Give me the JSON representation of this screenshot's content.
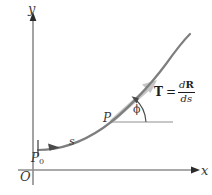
{
  "figure": {
    "type": "geometry-diagram",
    "background_color": "#ffffff",
    "axes": {
      "x_label": "x",
      "y_label": "y",
      "origin_label": "O",
      "axis_color": "#8c8c8c",
      "arrowhead_color": "#2b2b2b",
      "origin_px": {
        "x": 33,
        "y": 170
      },
      "x_end_px": {
        "x": 197,
        "y": 170
      },
      "y_end_px": {
        "x": 33,
        "y": 12
      }
    },
    "curve": {
      "color": "#7e7e7e",
      "width_px": 2.2,
      "start_px": {
        "x": 38,
        "y": 150
      },
      "end_px": {
        "x": 190,
        "y": 34
      },
      "shape": "concave-up increasing"
    },
    "labels": {
      "start_point": "P",
      "start_point_subscript": "0",
      "arc_length": "s",
      "tangent_point": "P",
      "angle": "ϕ"
    },
    "tangent_vector": {
      "color": "#c3c3c3",
      "label_lhs": "T",
      "label_eq": "=",
      "numerator_d": "d",
      "numerator_vec": "R",
      "denominator_d": "d",
      "denominator_s": "s"
    },
    "reference_line": {
      "color": "#b5b5b5",
      "from_px": {
        "x": 113,
        "y": 122
      },
      "to_px": {
        "x": 172,
        "y": 122
      }
    },
    "direction_arrow": {
      "color": "#4a4a4a",
      "tick_x_px": 38,
      "arrow_tip_px": {
        "x": 58,
        "y": 147
      }
    }
  }
}
